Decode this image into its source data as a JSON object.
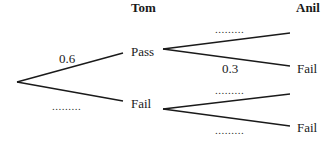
{
  "diagram": {
    "type": "probability-tree",
    "headers": {
      "stage1": "Tom",
      "stage2": "Anil"
    },
    "stage1": {
      "branches": [
        {
          "outcome": "Pass",
          "probability": "0.6"
        },
        {
          "outcome": "Fail",
          "probability": "........."
        }
      ]
    },
    "stage2": {
      "from_pass": [
        {
          "outcome": "",
          "probability": "........."
        },
        {
          "outcome": "Fail",
          "probability": "0.3"
        }
      ],
      "from_fail": [
        {
          "outcome": "",
          "probability": "........."
        },
        {
          "outcome": "Fail",
          "probability": "........."
        }
      ]
    },
    "line_color": "#1a1a1a"
  }
}
